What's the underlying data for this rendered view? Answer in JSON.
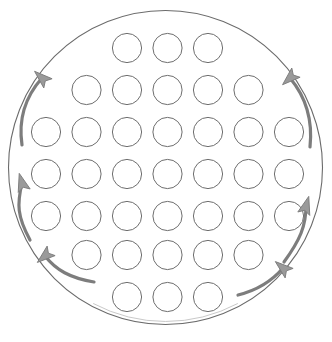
{
  "figure": {
    "title": "",
    "type": "cross-section-diagram",
    "background_color": "#ffffff",
    "width": 332,
    "height": 342
  },
  "vessel": {
    "name": "shell-outline",
    "shape": "circle",
    "cx": 165.5,
    "cy": 167.5,
    "r": 157,
    "stroke_color": "#6b6b6b",
    "stroke_width": 1.1,
    "fill": "none",
    "outline_gap": {
      "present": true,
      "location": "bottom",
      "note": "faint break in lower arc"
    }
  },
  "tube_bundle": {
    "name": "tube-bundle",
    "total_count": 37,
    "tube_radius": 14.6,
    "stroke_color": "#6e6e6e",
    "stroke_width": 1.0,
    "fill_color": "#ffffff",
    "row_pitch": 42,
    "col_pitch": 40.5,
    "rows": [
      {
        "index": 1,
        "count": 3,
        "cy": 48,
        "cx_start": 127.0
      },
      {
        "index": 2,
        "count": 5,
        "cy": 90,
        "cx_start": 86.5
      },
      {
        "index": 3,
        "count": 7,
        "cy": 132,
        "cx_start": 46.0
      },
      {
        "index": 4,
        "count": 7,
        "cy": 174,
        "cx_start": 46.0
      },
      {
        "index": 5,
        "count": 7,
        "cy": 216,
        "cx_start": 46.0
      },
      {
        "index": 6,
        "count": 5,
        "cy": 255,
        "cx_start": 86.5
      },
      {
        "index": 7,
        "count": 3,
        "cy": 297,
        "cx_start": 127.0
      }
    ]
  },
  "flow_arrows": {
    "name": "flow-arrows",
    "count": 6,
    "stroke_color": "#7d7d7d",
    "fill_color": "#9a9a9a",
    "stroke_width": 3.2,
    "direction_note": "all arrows point upward along the shell wall",
    "items": [
      {
        "id": "arrow-upper-left",
        "label": "upward flow",
        "side": "left",
        "position": "upper",
        "d": "M 22 145 C 18 118 26 96 42 78",
        "tip": {
          "x": 42,
          "y": 78
        },
        "angle": -48
      },
      {
        "id": "arrow-middle-left",
        "label": "upward flow",
        "side": "left",
        "position": "middle",
        "d": "M 30 240 C 17 216 17 204 22 183",
        "tip": {
          "x": 22,
          "y": 183
        },
        "angle": -16
      },
      {
        "id": "arrow-lower-left",
        "label": "upward flow",
        "side": "left",
        "position": "lower",
        "d": "M 94 282 C 70 278 56 270 45 256",
        "tip": {
          "x": 45,
          "y": 256
        },
        "angle": -130
      },
      {
        "id": "arrow-upper-right",
        "label": "upward flow",
        "side": "right",
        "position": "upper",
        "d": "M 310 147 C 313 119 305 96 290 78",
        "tip": {
          "x": 290,
          "y": 78
        },
        "angle": -132
      },
      {
        "id": "arrow-middle-right",
        "label": "upward flow",
        "side": "right",
        "position": "middle",
        "d": "M 284 262 C 300 240 306 226 306 206",
        "tip": {
          "x": 306,
          "y": 206
        },
        "angle": 16
      },
      {
        "id": "arrow-lower-right",
        "label": "upward flow",
        "side": "right",
        "position": "lower",
        "d": "M 238 295 C 258 290 272 281 283 268",
        "tip": {
          "x": 283,
          "y": 268
        },
        "angle": -50
      }
    ]
  }
}
